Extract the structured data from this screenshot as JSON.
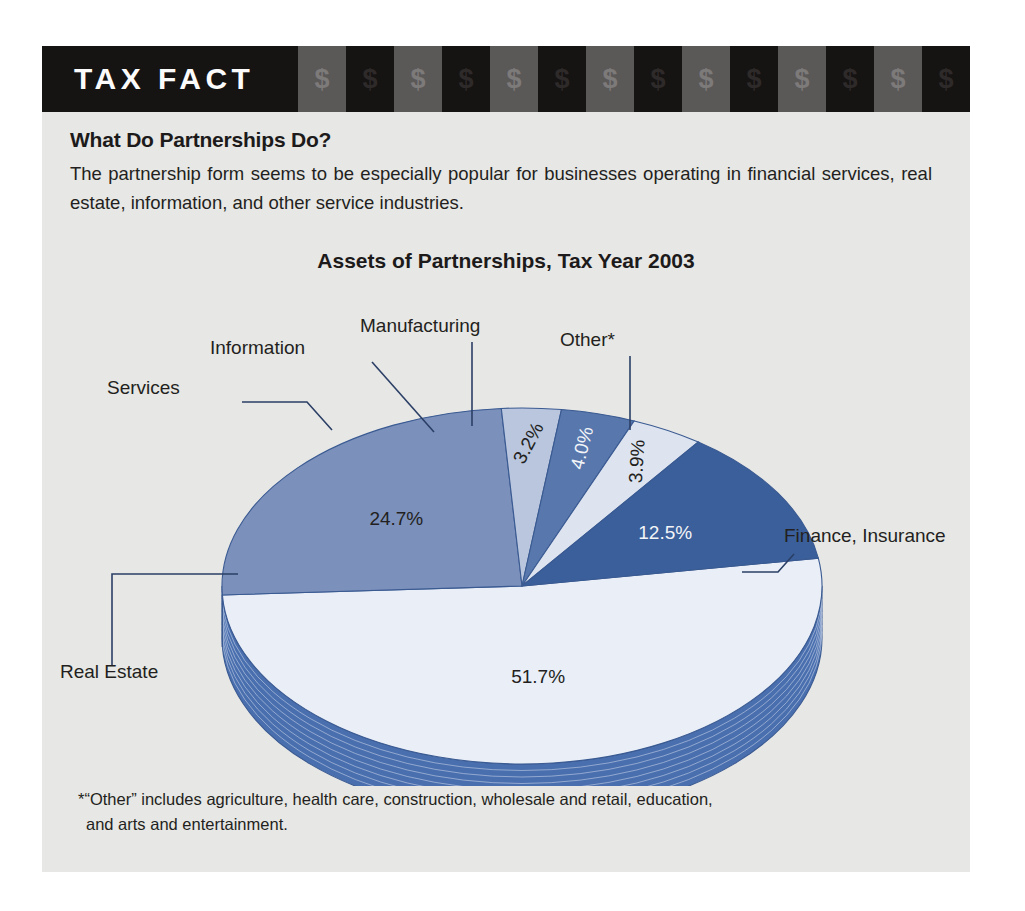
{
  "banner": {
    "label": "TAX FACT",
    "money_glyph": "$",
    "block_count": 14,
    "dark_color": "#161313",
    "gray_color": "#5b5858"
  },
  "article": {
    "heading": "What Do Partnerships Do?",
    "intro_line_1": "The partnership form seems to be especially popular for businesses operating in",
    "intro_line_2": "financial services, real estate, information, and other service industries.",
    "footnote_line_1": "*“Other” includes agriculture, health care, construction, wholesale and retail, education,",
    "footnote_line_2": "and arts and entertainment."
  },
  "chart_data": {
    "type": "pie",
    "title": "Assets of Partnerships, Tax Year 2003",
    "xlabel": "",
    "ylabel": "",
    "legend_position": "callout-labels",
    "grid": false,
    "units": "percent of total assets",
    "categories": [
      "Finance, Insurance",
      "Real Estate",
      "Services",
      "Information",
      "Manufacturing",
      "Other*"
    ],
    "values": [
      51.7,
      24.7,
      3.2,
      4.0,
      3.9,
      12.5
    ],
    "labels": [
      "51.7%",
      "24.7%",
      "3.2%",
      "4.0%",
      "3.9%",
      "12.5%"
    ],
    "colors": [
      "#e9eef7",
      "#7b90ba",
      "#b9c6dd",
      "#5878ad",
      "#dde4f0",
      "#3a5f9a"
    ],
    "side_color": "#4a6fae",
    "outline_color": "#3a5a92",
    "slices": [
      {
        "name": "Finance, Insurance",
        "value": 51.7,
        "label": "51.7%",
        "color": "#e9eef7",
        "label_color": "#231f20"
      },
      {
        "name": "Real Estate",
        "value": 24.7,
        "label": "24.7%",
        "color": "#7b90ba",
        "label_color": "#231f20"
      },
      {
        "name": "Services",
        "value": 3.2,
        "label": "3.2%",
        "color": "#b9c6dd",
        "label_color": "#231f20"
      },
      {
        "name": "Information",
        "value": 4.0,
        "label": "4.0%",
        "color": "#5878ad",
        "label_color": "#f2f4f8"
      },
      {
        "name": "Manufacturing",
        "value": 3.9,
        "label": "3.9%",
        "color": "#dde4f0",
        "label_color": "#231f20"
      },
      {
        "name": "Other*",
        "value": 12.5,
        "label": "12.5%",
        "color": "#3a5f9a",
        "label_color": "#f2f4f8"
      }
    ],
    "callouts": [
      {
        "name": "Services",
        "text": "Services"
      },
      {
        "name": "Information",
        "text": "Information"
      },
      {
        "name": "Manufacturing",
        "text": "Manufacturing"
      },
      {
        "name": "Other*",
        "text": "Other*"
      },
      {
        "name": "Finance, Insurance",
        "text": "Finance, Insurance"
      },
      {
        "name": "Real Estate",
        "text": "Real Estate"
      }
    ]
  }
}
